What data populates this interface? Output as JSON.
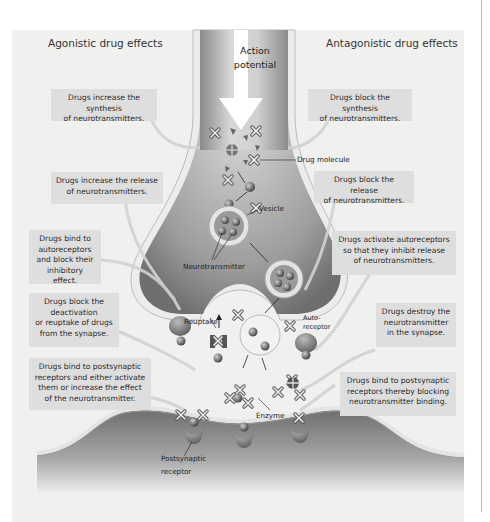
{
  "headings": {
    "agonistic": "Agonistic drug effects",
    "antagonistic": "Antagonistic drug effects"
  },
  "action_potential": {
    "line1": "Action",
    "line2": "potential"
  },
  "agonistic_boxes": [
    {
      "lines": [
        "Drugs increase the synthesis",
        "of neurotransmitters."
      ]
    },
    {
      "lines": [
        "Drugs increase the release",
        "of neurotransmitters."
      ]
    },
    {
      "lines": [
        "Drugs bind to",
        "autoreceptors",
        "and block their",
        "inhibitory effect."
      ]
    },
    {
      "lines": [
        "Drugs block the",
        "deactivation",
        "or reuptake of drugs",
        "from the synapse."
      ]
    },
    {
      "lines": [
        "Drugs bind to postsynaptic",
        "receptors and either activate",
        "them or increase the effect",
        "of the neurotransmitter."
      ]
    }
  ],
  "antagonistic_boxes": [
    {
      "lines": [
        "Drugs block the synthesis",
        "of neurotransmitters."
      ]
    },
    {
      "lines": [
        "Drugs block the release",
        "of neurotransmitters."
      ]
    },
    {
      "lines": [
        "Drugs activate autoreceptors",
        "so that they inhibit release",
        "of neurotransmitters."
      ]
    },
    {
      "lines": [
        "Drugs destroy the",
        "neurotransmitter",
        "in the synapse."
      ]
    },
    {
      "lines": [
        "Drugs bind to postsynaptic",
        "receptors thereby blocking",
        "neurotransmitter binding."
      ]
    }
  ],
  "labels": {
    "drug_molecule": "Drug molecule",
    "vesicle": "Vesicle",
    "neurotransmitter": "Neurotransmitter",
    "reuptake": "Reuptake",
    "autoreceptor_1": "Auto-",
    "autoreceptor_2": "receptor",
    "enzyme": "Enzyme",
    "postsynaptic_1": "Postsynaptic",
    "postsynaptic_2": "receptor"
  },
  "colors": {
    "panel_bg": "#f0f0ef",
    "box_bg": "#dedede",
    "neuron_dark": "#7a7a7a",
    "neuron_light": "#cfcfcf",
    "membrane": "#e8e8e8"
  }
}
